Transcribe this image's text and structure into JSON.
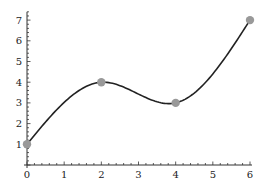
{
  "chart_data": {
    "type": "line",
    "title": "",
    "xlabel": "",
    "ylabel": "",
    "xlim": [
      0,
      6
    ],
    "ylim": [
      0,
      7.4
    ],
    "grid": false,
    "legend": null,
    "x_ticks": [
      "0",
      "1",
      "2",
      "3",
      "4",
      "5",
      "6"
    ],
    "y_ticks": [
      "1",
      "2",
      "3",
      "4",
      "5",
      "6",
      "7"
    ],
    "points": {
      "x": [
        0,
        2,
        4,
        6
      ],
      "y": [
        1,
        4,
        3,
        7
      ]
    },
    "curve": "smooth cubic interpolation through points",
    "series": [
      {
        "name": "interpolating curve",
        "x": [
          0,
          2,
          4,
          6
        ],
        "y": [
          1,
          4,
          3,
          7
        ],
        "color": "#222222"
      },
      {
        "name": "data points",
        "x": [
          0,
          2,
          4,
          6
        ],
        "y": [
          1,
          4,
          3,
          7
        ],
        "color": "#999999",
        "marker": "circle"
      }
    ]
  },
  "colors": {
    "curve": "#222222",
    "marker": "#999999",
    "axis": "#333333"
  }
}
